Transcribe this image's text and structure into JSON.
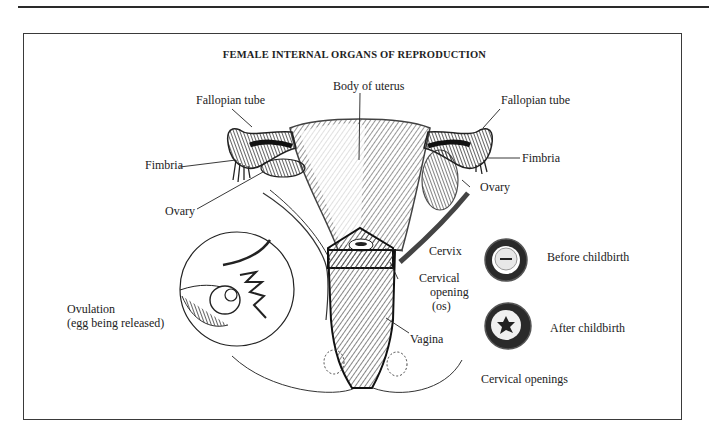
{
  "page": {
    "header_rule": true
  },
  "figure": {
    "title": "FEMALE INTERNAL ORGANS OF REPRODUCTION",
    "labels": {
      "body_of_uterus": "Body of uterus",
      "fallopian_tube_left": "Fallopian tube",
      "fallopian_tube_right": "Fallopian tube",
      "fimbria_left": "Fimbria",
      "fimbria_right": "Fimbria",
      "ovary_left": "Ovary",
      "ovary_right": "Ovary",
      "cervix": "Cervix",
      "cervical_opening_line1": "Cervical",
      "cervical_opening_line2": "opening",
      "cervical_opening_line3": "(os)",
      "vagina": "Vagina",
      "ovulation_line1": "Ovulation",
      "ovulation_line2": "(egg being released)",
      "before_childbirth": "Before childbirth",
      "after_childbirth": "After childbirth",
      "cervical_openings": "Cervical openings"
    },
    "insets": [
      {
        "name": "ovulation-inset",
        "caption": "Ovulation (egg being released)"
      },
      {
        "name": "cervical-opening-before",
        "caption": "Before childbirth"
      },
      {
        "name": "cervical-opening-after",
        "caption": "After childbirth"
      }
    ]
  }
}
